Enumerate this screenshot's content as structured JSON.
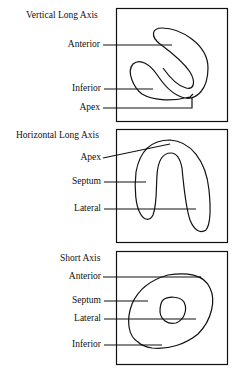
{
  "panels": [
    {
      "title": "Vertical Long Axis",
      "labels": [
        "Anterior",
        "Inferior",
        "Apex"
      ]
    },
    {
      "title": "Horizontal Long Axis",
      "labels": [
        "Apex",
        "Septum",
        "Lateral"
      ]
    },
    {
      "title": "Short Axis",
      "labels": [
        "Anterior",
        "Septum",
        "Lateral",
        "Inferior"
      ]
    }
  ],
  "colors": {
    "line": "#111111",
    "background": "#ffffff"
  }
}
